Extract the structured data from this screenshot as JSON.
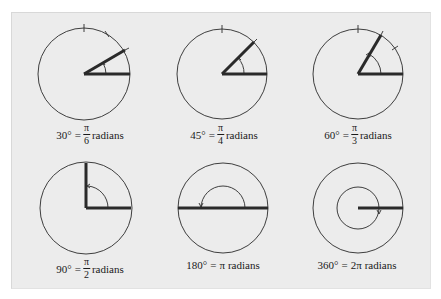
{
  "figure": {
    "background": "#ececec",
    "stroke_color": "#2a2a2a",
    "panels": [
      {
        "degrees": "30°",
        "equals": "=",
        "numerator": "π",
        "denominator": "6",
        "unit": "radians",
        "angle_deg": 30
      },
      {
        "degrees": "45°",
        "equals": "=",
        "numerator": "π",
        "denominator": "4",
        "unit": "radians",
        "angle_deg": 45
      },
      {
        "degrees": "60°",
        "equals": "=",
        "numerator": "π",
        "denominator": "3",
        "unit": "radians",
        "angle_deg": 60
      },
      {
        "degrees": "90°",
        "equals": "=",
        "numerator": "π",
        "denominator": "2",
        "unit": "radians",
        "angle_deg": 90
      },
      {
        "degrees": "180°",
        "equals": "=",
        "radian_value": "π",
        "unit": "radians",
        "angle_deg": 180
      },
      {
        "degrees": "360°",
        "equals": "=",
        "radian_value": "2π",
        "unit": "radians",
        "angle_deg": 360
      }
    ]
  }
}
